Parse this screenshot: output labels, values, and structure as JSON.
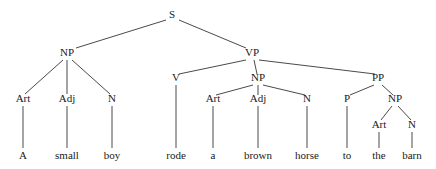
{
  "figure": {
    "sentence": "A small boy rode a brown horse to the barn",
    "background_color": "#ffffff",
    "line_color": "#4a4a4a",
    "text_color": "#1a1a1a"
  },
  "nodes": [
    {
      "id": "s",
      "label": "S",
      "x": 172,
      "y": 18,
      "kind": "nonterminal"
    },
    {
      "id": "np1",
      "label": "NP",
      "x": 67,
      "y": 56,
      "kind": "nonterminal"
    },
    {
      "id": "vp",
      "label": "VP",
      "x": 252,
      "y": 56,
      "kind": "nonterminal"
    },
    {
      "id": "art1",
      "label": "Art",
      "x": 23,
      "y": 102,
      "kind": "preterminal"
    },
    {
      "id": "adj1",
      "label": "Adj",
      "x": 67,
      "y": 102,
      "kind": "preterminal"
    },
    {
      "id": "n1",
      "label": "N",
      "x": 112,
      "y": 102,
      "kind": "preterminal"
    },
    {
      "id": "v",
      "label": "V",
      "x": 176,
      "y": 81,
      "kind": "preterminal"
    },
    {
      "id": "np2",
      "label": "NP",
      "x": 258,
      "y": 81,
      "kind": "nonterminal"
    },
    {
      "id": "pp",
      "label": "PP",
      "x": 378,
      "y": 81,
      "kind": "nonterminal"
    },
    {
      "id": "art2",
      "label": "Art",
      "x": 213,
      "y": 102,
      "kind": "preterminal"
    },
    {
      "id": "adj2",
      "label": "Adj",
      "x": 258,
      "y": 102,
      "kind": "preterminal"
    },
    {
      "id": "n2",
      "label": "N",
      "x": 307,
      "y": 102,
      "kind": "preterminal"
    },
    {
      "id": "p",
      "label": "P",
      "x": 347,
      "y": 102,
      "kind": "preterminal"
    },
    {
      "id": "np3",
      "label": "NP",
      "x": 395,
      "y": 102,
      "kind": "nonterminal"
    },
    {
      "id": "art3",
      "label": "Art",
      "x": 379,
      "y": 128,
      "kind": "preterminal"
    },
    {
      "id": "n3",
      "label": "N",
      "x": 412,
      "y": 128,
      "kind": "preterminal"
    }
  ],
  "leaves": [
    {
      "id": "w-a",
      "label": "A",
      "x": 23,
      "y": 159
    },
    {
      "id": "w-small",
      "label": "small",
      "x": 67,
      "y": 159
    },
    {
      "id": "w-boy",
      "label": "boy",
      "x": 112,
      "y": 159
    },
    {
      "id": "w-rode",
      "label": "rode",
      "x": 176,
      "y": 159
    },
    {
      "id": "w-a2",
      "label": "a",
      "x": 213,
      "y": 159
    },
    {
      "id": "w-brown",
      "label": "brown",
      "x": 258,
      "y": 159
    },
    {
      "id": "w-horse",
      "label": "horse",
      "x": 307,
      "y": 159
    },
    {
      "id": "w-to",
      "label": "to",
      "x": 347,
      "y": 159
    },
    {
      "id": "w-the",
      "label": "the",
      "x": 379,
      "y": 159
    },
    {
      "id": "w-barn",
      "label": "barn",
      "x": 412,
      "y": 159
    }
  ],
  "edges": [
    {
      "id": "e-s-np1",
      "from": "S",
      "to": "NP",
      "x1": 166,
      "y1": 20,
      "x2": 76,
      "y2": 48
    },
    {
      "id": "e-s-vp",
      "from": "S",
      "to": "VP",
      "x1": 179,
      "y1": 20,
      "x2": 246,
      "y2": 48
    },
    {
      "id": "e-np1-art1",
      "from": "NP",
      "to": "Art",
      "x1": 63,
      "y1": 60,
      "x2": 25,
      "y2": 94
    },
    {
      "id": "e-np1-adj1",
      "from": "NP",
      "to": "Adj",
      "x1": 67,
      "y1": 60,
      "x2": 67,
      "y2": 94
    },
    {
      "id": "e-np1-n1",
      "from": "NP",
      "to": "N",
      "x1": 72,
      "y1": 60,
      "x2": 110,
      "y2": 94
    },
    {
      "id": "e-vp-v",
      "from": "VP",
      "to": "V",
      "x1": 246,
      "y1": 60,
      "x2": 179,
      "y2": 74
    },
    {
      "id": "e-vp-np2",
      "from": "VP",
      "to": "NP",
      "x1": 254,
      "y1": 60,
      "x2": 257,
      "y2": 74
    },
    {
      "id": "e-vp-pp",
      "from": "VP",
      "to": "PP",
      "x1": 259,
      "y1": 60,
      "x2": 375,
      "y2": 74
    },
    {
      "id": "e-np2-art2",
      "from": "NP",
      "to": "Art",
      "x1": 253,
      "y1": 85,
      "x2": 216,
      "y2": 95
    },
    {
      "id": "e-np2-adj2",
      "from": "NP",
      "to": "Adj",
      "x1": 258,
      "y1": 85,
      "x2": 258,
      "y2": 95
    },
    {
      "id": "e-np2-n2",
      "from": "NP",
      "to": "N",
      "x1": 263,
      "y1": 85,
      "x2": 305,
      "y2": 95
    },
    {
      "id": "e-pp-p",
      "from": "PP",
      "to": "P",
      "x1": 374,
      "y1": 85,
      "x2": 350,
      "y2": 95
    },
    {
      "id": "e-pp-np3",
      "from": "PP",
      "to": "NP",
      "x1": 382,
      "y1": 85,
      "x2": 393,
      "y2": 95
    },
    {
      "id": "e-np3-art3",
      "from": "NP",
      "to": "Art",
      "x1": 392,
      "y1": 106,
      "x2": 381,
      "y2": 120
    },
    {
      "id": "e-np3-n3",
      "from": "NP",
      "to": "N",
      "x1": 398,
      "y1": 106,
      "x2": 411,
      "y2": 120
    },
    {
      "id": "e-art1-a",
      "from": "Art",
      "to": "A",
      "x1": 23,
      "y1": 106,
      "x2": 23,
      "y2": 148
    },
    {
      "id": "e-adj1-small",
      "from": "Adj",
      "to": "small",
      "x1": 67,
      "y1": 106,
      "x2": 67,
      "y2": 148
    },
    {
      "id": "e-n1-boy",
      "from": "N",
      "to": "boy",
      "x1": 112,
      "y1": 106,
      "x2": 112,
      "y2": 148
    },
    {
      "id": "e-v-rode",
      "from": "V",
      "to": "rode",
      "x1": 176,
      "y1": 85,
      "x2": 176,
      "y2": 148
    },
    {
      "id": "e-art2-a2",
      "from": "Art",
      "to": "a",
      "x1": 213,
      "y1": 106,
      "x2": 213,
      "y2": 148
    },
    {
      "id": "e-adj2-brown",
      "from": "Adj",
      "to": "brown",
      "x1": 258,
      "y1": 106,
      "x2": 258,
      "y2": 148
    },
    {
      "id": "e-n2-horse",
      "from": "N",
      "to": "horse",
      "x1": 307,
      "y1": 106,
      "x2": 307,
      "y2": 148
    },
    {
      "id": "e-p-to",
      "from": "P",
      "to": "to",
      "x1": 347,
      "y1": 106,
      "x2": 347,
      "y2": 148
    },
    {
      "id": "e-art3-the",
      "from": "Art",
      "to": "the",
      "x1": 379,
      "y1": 132,
      "x2": 379,
      "y2": 148
    },
    {
      "id": "e-n3-barn",
      "from": "N",
      "to": "barn",
      "x1": 412,
      "y1": 132,
      "x2": 412,
      "y2": 148
    }
  ]
}
